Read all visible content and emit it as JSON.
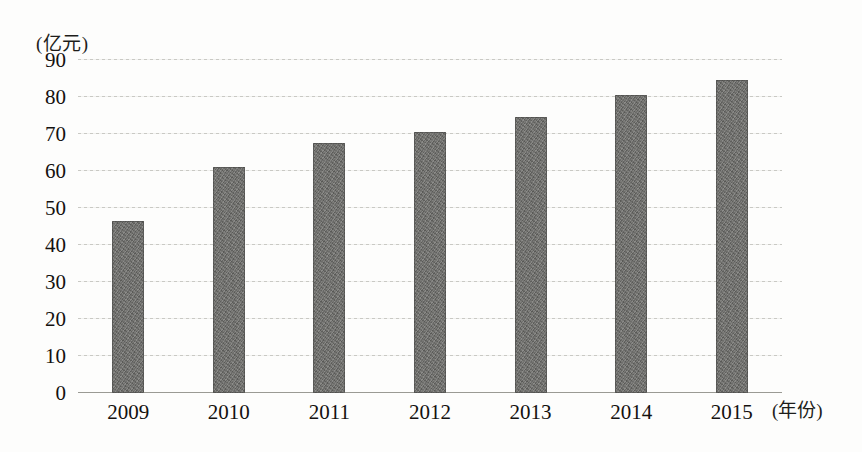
{
  "chart_data": {
    "type": "bar",
    "title": "",
    "subtitle": "",
    "unit_label": "(亿元)",
    "xlabel": "(年份)",
    "ylabel": "",
    "categories": [
      "2009",
      "2010",
      "2011",
      "2012",
      "2013",
      "2014",
      "2015"
    ],
    "values": [
      46.5,
      61,
      67.5,
      70.5,
      74.5,
      80.5,
      84.5
    ],
    "series": [
      {
        "name": "金额",
        "values": [
          46.5,
          61,
          67.5,
          70.5,
          74.5,
          80.5,
          84.5
        ]
      }
    ],
    "ylim": [
      0,
      90
    ],
    "ytick_labels": [
      "0",
      "10",
      "20",
      "30",
      "40",
      "50",
      "60",
      "70",
      "80",
      "90"
    ],
    "ytick_values": [
      0,
      10,
      20,
      30,
      40,
      50,
      60,
      70,
      80,
      90
    ],
    "grid": true,
    "grid_style": "dotted-horizontal",
    "legend": "none",
    "bar_color": "#6d6d6a",
    "background_color": "#fdfdfc",
    "axis_color": "#9a9a94",
    "text_color": "#14110f"
  }
}
